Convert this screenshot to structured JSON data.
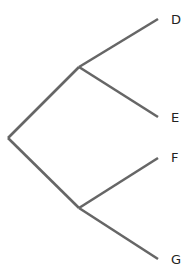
{
  "diagram": {
    "type": "tree",
    "orientation": "left-to-right",
    "line_color": "#666666",
    "label_color": "#222222",
    "nodes": {
      "root": {
        "x": 8,
        "y": 138
      },
      "upper": {
        "x": 79,
        "y": 67
      },
      "lower": {
        "x": 79,
        "y": 208
      }
    },
    "leaves": [
      {
        "label": "D",
        "x": 158,
        "y": 19,
        "label_x": 171,
        "label_y": 20,
        "parent": "upper"
      },
      {
        "label": "E",
        "x": 158,
        "y": 117,
        "label_x": 171,
        "label_y": 118,
        "parent": "upper"
      },
      {
        "label": "F",
        "x": 158,
        "y": 158,
        "label_x": 171,
        "label_y": 158,
        "parent": "lower"
      },
      {
        "label": "G",
        "x": 158,
        "y": 259,
        "label_x": 171,
        "label_y": 260,
        "parent": "lower"
      }
    ]
  }
}
